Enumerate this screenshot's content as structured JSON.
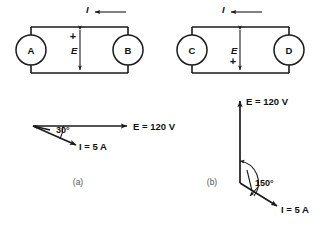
{
  "figure": {
    "background_color": "#ffffff",
    "line_color": "#1a1a1a",
    "text_color": "#111111"
  },
  "panel_a": {
    "caption": "(a)",
    "circuit": {
      "left_device_label": "A",
      "right_device_label": "B",
      "current_symbol": "I",
      "current_arrow_direction": "left",
      "voltage_symbol": "E",
      "polarity_sign": "+",
      "polarity_position": "top"
    },
    "phasor": {
      "voltage_label": "E = 120 V",
      "current_label": "I = 5 A",
      "angle_label": "30°",
      "voltage_direction": "right",
      "current_direction": "down-right",
      "angle_degrees": 30
    }
  },
  "panel_b": {
    "caption": "(b)",
    "circuit": {
      "left_device_label": "C",
      "right_device_label": "D",
      "current_symbol": "I",
      "current_arrow_direction": "left",
      "voltage_symbol": "E",
      "polarity_sign": "+",
      "polarity_position": "bottom"
    },
    "phasor": {
      "voltage_label": "E = 120 V",
      "current_label": "I = 5 A",
      "angle_label": "150°",
      "voltage_direction": "up",
      "current_direction": "down-right",
      "angle_degrees": 150
    }
  }
}
